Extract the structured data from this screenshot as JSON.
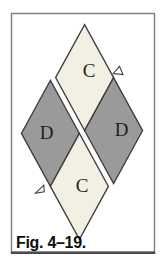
{
  "figure": {
    "caption": "Fig. 4–19.",
    "patches": {
      "top": {
        "label": "C",
        "tone": "light"
      },
      "left": {
        "label": "D",
        "tone": "dark"
      },
      "right": {
        "label": "D",
        "tone": "dark"
      },
      "bottom": {
        "label": "C",
        "tone": "light"
      }
    }
  },
  "colors": {
    "background": "#ffffff",
    "light_patch": "#f2f0e3",
    "dark_patch": "#9a9a9a",
    "patch_outline": "#3d3d3d",
    "frame_border": "#7d7d7d",
    "frame_bottom_border": "#4b4b4b",
    "label_text": "#1f1f1f",
    "caption_text": "#0e0e0e"
  }
}
